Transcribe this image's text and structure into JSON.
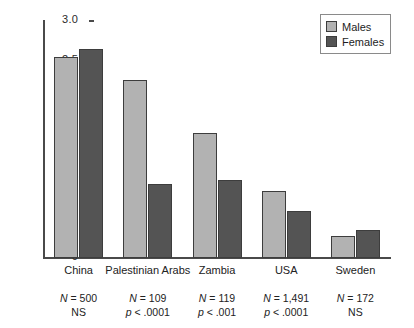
{
  "chart_data": {
    "type": "bar",
    "title": "",
    "subtitle": "",
    "xlabel": "",
    "ylabel": "",
    "ylim": [
      0,
      3.0
    ],
    "grid": false,
    "legend_position": "top-right",
    "categories": [
      "China",
      "Palestinian Arabs",
      "Zambia",
      "USA",
      "Sweden"
    ],
    "ytick_labels": [
      "0",
      ".5",
      "1.0",
      "1.5",
      "2.0",
      "2.5",
      "3.0"
    ],
    "ytick_values": [
      0,
      0.5,
      1.0,
      1.5,
      2.0,
      2.5,
      3.0
    ],
    "series": [
      {
        "name": "Males",
        "color": "#b2b2b2",
        "values": [
          2.55,
          2.25,
          1.58,
          0.85,
          0.28
        ]
      },
      {
        "name": "Females",
        "color": "#545454",
        "values": [
          2.65,
          0.94,
          0.99,
          0.6,
          0.35
        ]
      }
    ],
    "annotations": [
      {
        "category": "China",
        "n": "N = 500",
        "significance": "NS"
      },
      {
        "category": "Palestinian Arabs",
        "n": "N = 109",
        "significance": "p < .0001"
      },
      {
        "category": "Zambia",
        "n": "N = 119",
        "significance": "p < .001"
      },
      {
        "category": "USA",
        "n": "N = 1,491",
        "significance": "p < .0001"
      },
      {
        "category": "Sweden",
        "n": "N = 172",
        "significance": "NS"
      }
    ]
  },
  "legend": {
    "items": [
      {
        "label": "Males",
        "swatch": "legend-swatch-males"
      },
      {
        "label": "Females",
        "swatch": "legend-swatch-females"
      }
    ]
  },
  "colors": {
    "males": "#b2b2b2",
    "females": "#545454",
    "axis": "#4a4a4a",
    "bar_border": "#3d3d3d",
    "background": "#ffffff"
  }
}
